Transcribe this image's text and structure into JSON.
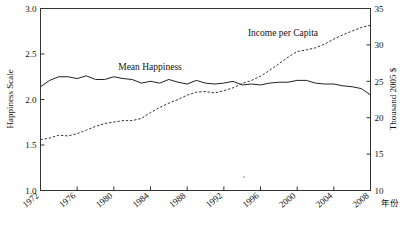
{
  "chart_data": {
    "type": "line",
    "title": "",
    "subtitle": "",
    "xlabel": "年份",
    "ylabel": "Happiness Scale",
    "y2label": "Thousand 2005 $",
    "grid": false,
    "legend_position": "inline-annotations",
    "xlim": [
      1972,
      2008
    ],
    "ylim": [
      1.0,
      3.0
    ],
    "y2lim": [
      10,
      35
    ],
    "xticks": [
      1972,
      1976,
      1980,
      1984,
      1988,
      1992,
      1996,
      2000,
      2004,
      2008
    ],
    "xtick_labels": [
      "1972",
      "1976",
      "1980",
      "1984",
      "1988",
      "1992",
      "1996",
      "2000",
      "2004",
      "2008"
    ],
    "yticks": [
      1.0,
      1.5,
      2.0,
      2.5,
      3.0
    ],
    "ytick_labels": [
      "1.0",
      "1.5",
      "2.0",
      "2.5",
      "3.0"
    ],
    "y2ticks": [
      10,
      15,
      20,
      25,
      30,
      35
    ],
    "y2tick_labels": [
      "10",
      "15",
      "20",
      "25",
      "30",
      "35"
    ],
    "x": [
      1972,
      1973,
      1974,
      1975,
      1976,
      1977,
      1978,
      1979,
      1980,
      1981,
      1982,
      1983,
      1984,
      1985,
      1986,
      1987,
      1988,
      1989,
      1990,
      1991,
      1992,
      1993,
      1994,
      1995,
      1996,
      1997,
      1998,
      1999,
      2000,
      2001,
      2002,
      2003,
      2004,
      2005,
      2006,
      2007,
      2008
    ],
    "series": [
      {
        "name": "Mean Happiness",
        "axis": "left",
        "style": "solid",
        "units": "Happiness Scale (1-3)",
        "values": [
          2.14,
          2.21,
          2.25,
          2.25,
          2.23,
          2.26,
          2.22,
          2.22,
          2.25,
          2.23,
          2.22,
          2.18,
          2.2,
          2.18,
          2.22,
          2.19,
          2.17,
          2.21,
          2.18,
          2.17,
          2.18,
          2.2,
          2.16,
          2.17,
          2.16,
          2.18,
          2.19,
          2.19,
          2.21,
          2.21,
          2.18,
          2.17,
          2.17,
          2.15,
          2.14,
          2.12,
          2.05
        ]
      },
      {
        "name": "Income per Capita",
        "axis": "right",
        "style": "dashed",
        "units": "Thousand 2005 $",
        "values": [
          17.0,
          17.2,
          17.6,
          17.5,
          17.8,
          18.3,
          18.8,
          19.2,
          19.4,
          19.6,
          19.6,
          19.9,
          20.7,
          21.4,
          22.0,
          22.5,
          23.1,
          23.5,
          23.6,
          23.4,
          23.7,
          24.1,
          24.7,
          25.1,
          25.7,
          26.5,
          27.4,
          28.3,
          29.1,
          29.3,
          29.6,
          30.1,
          30.8,
          31.4,
          31.9,
          32.4,
          32.7
        ]
      }
    ],
    "annotations": [
      {
        "text": "Mean Happiness",
        "series": "Mean Happiness"
      },
      {
        "text": "Income per Capita",
        "series": "Income per Capita"
      }
    ]
  }
}
